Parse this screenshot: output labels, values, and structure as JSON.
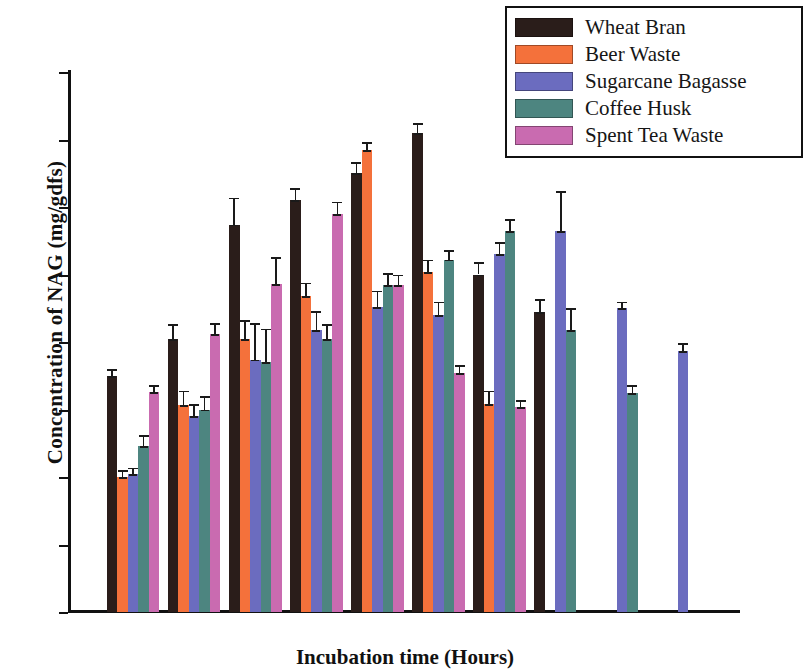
{
  "chart_data": {
    "type": "bar",
    "title": "",
    "xlabel": "Incubation time (Hours)",
    "ylabel": "Concentration of NAG (mg/gdfs)",
    "categories": [
      "24",
      "48",
      "72",
      "96",
      "120",
      "144",
      "168",
      "192",
      "216",
      "240"
    ],
    "x_tick_labels": [
      "0",
      "24",
      "48",
      "72",
      "96",
      "120",
      "144",
      "168",
      "192",
      "216",
      "240",
      "264"
    ],
    "y_tick_labels": [
      "0",
      "5",
      "10",
      "15",
      "20",
      "25",
      "30",
      "35",
      "40"
    ],
    "xlim": [
      0,
      264
    ],
    "ylim": [
      0,
      40
    ],
    "grid": false,
    "legend_position": "top-right",
    "error_bars": true,
    "series": [
      {
        "name": "Wheat Bran",
        "color": "#2a1d1a",
        "values": [
          17.5,
          20.2,
          28.7,
          30.5,
          32.5,
          35.5,
          25.0,
          22.2,
          null,
          null
        ],
        "errors": [
          0.5,
          1.1,
          2.0,
          0.9,
          0.8,
          0.7,
          0.9,
          1.0,
          null,
          null
        ]
      },
      {
        "name": "Beer Waste",
        "color": "#f4713b",
        "values": [
          10.0,
          15.3,
          20.2,
          23.4,
          34.2,
          25.2,
          15.4,
          null,
          null,
          null
        ],
        "errors": [
          0.5,
          1.1,
          1.4,
          1.0,
          0.6,
          0.9,
          1.0,
          null,
          null,
          null
        ]
      },
      {
        "name": "Sugarcane Bagasse",
        "color": "#6b6cbf",
        "values": [
          10.2,
          14.5,
          18.7,
          20.9,
          22.6,
          22.0,
          26.5,
          28.2,
          22.5,
          19.3
        ],
        "errors": [
          0.5,
          0.9,
          2.7,
          1.4,
          1.2,
          1.0,
          0.9,
          3.0,
          0.5,
          0.6
        ]
      },
      {
        "name": "Coffee Husk",
        "color": "#4d8580",
        "values": [
          12.3,
          15.0,
          18.5,
          20.2,
          24.2,
          26.1,
          28.2,
          20.9,
          16.2,
          null
        ],
        "errors": [
          0.8,
          1.0,
          2.5,
          1.1,
          0.9,
          0.7,
          0.9,
          1.6,
          0.6,
          null
        ]
      },
      {
        "name": "Spent Tea Waste",
        "color": "#c96bb0",
        "values": [
          16.3,
          20.6,
          24.3,
          29.5,
          24.2,
          17.7,
          15.2,
          null,
          null,
          null
        ],
        "errors": [
          0.5,
          0.8,
          2.0,
          0.9,
          0.8,
          0.6,
          0.5,
          null,
          null,
          null
        ]
      }
    ]
  },
  "legend": {
    "items": [
      {
        "label": "Wheat Bran",
        "color": "#2a1d1a"
      },
      {
        "label": "Beer Waste",
        "color": "#f4713b"
      },
      {
        "label": "Sugarcane Bagasse",
        "color": "#6b6cbf"
      },
      {
        "label": "Coffee Husk",
        "color": "#4d8580"
      },
      {
        "label": "Spent Tea Waste",
        "color": "#c96bb0"
      }
    ]
  },
  "axes": {
    "y_title": "Concentration of NAG (mg/gdfs)",
    "x_title": "Incubation time (Hours)"
  }
}
